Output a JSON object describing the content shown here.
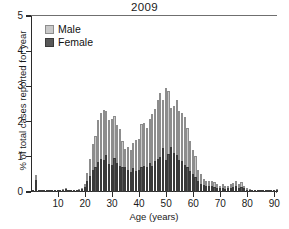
{
  "chart_data": {
    "type": "bar",
    "title": "2009",
    "xlabel": "Age (years)",
    "ylabel": "% of total cases reported for year",
    "xlim": [
      0,
      91
    ],
    "ylim": [
      0,
      5
    ],
    "xticks": [
      10,
      20,
      30,
      40,
      50,
      60,
      70,
      80,
      90
    ],
    "yticks": [
      0,
      1,
      2,
      3,
      4,
      5
    ],
    "grid": false,
    "stacked": true,
    "legend_position": "top-left",
    "bin_width_years": 1,
    "colors": {
      "male": "#c9c9c9",
      "female": "#585858",
      "axis": "#2b2b2b"
    },
    "x": [
      0,
      1,
      2,
      3,
      4,
      5,
      6,
      7,
      8,
      9,
      10,
      11,
      12,
      13,
      14,
      15,
      16,
      17,
      18,
      19,
      20,
      21,
      22,
      23,
      24,
      25,
      26,
      27,
      28,
      29,
      30,
      31,
      32,
      33,
      34,
      35,
      36,
      37,
      38,
      39,
      40,
      41,
      42,
      43,
      44,
      45,
      46,
      47,
      48,
      49,
      50,
      51,
      52,
      53,
      54,
      55,
      56,
      57,
      58,
      59,
      60,
      61,
      62,
      63,
      64,
      65,
      66,
      67,
      68,
      69,
      70,
      71,
      72,
      73,
      74,
      75,
      76,
      77,
      78,
      79,
      80,
      81,
      82,
      83,
      84,
      85,
      86,
      87,
      88,
      89,
      90
    ],
    "series": [
      {
        "name": "Male",
        "values": [
          0.02,
          0.47,
          0.05,
          0.03,
          0.04,
          0.02,
          0.06,
          0.05,
          0.04,
          0.06,
          0.03,
          0.08,
          0.1,
          0.07,
          0.06,
          0.05,
          0.04,
          0.08,
          0.1,
          0.22,
          0.55,
          0.95,
          1.35,
          1.6,
          2.05,
          2.25,
          2.32,
          2.3,
          2.05,
          2.08,
          2.17,
          1.9,
          1.78,
          1.45,
          1.22,
          1.28,
          1.18,
          1.38,
          1.48,
          1.5,
          1.92,
          1.95,
          1.82,
          2.08,
          2.22,
          2.35,
          2.6,
          2.8,
          2.62,
          2.95,
          2.88,
          2.38,
          2.45,
          2.6,
          2.3,
          2.25,
          2.12,
          1.82,
          1.45,
          1.2,
          1.02,
          0.62,
          0.52,
          0.38,
          0.32,
          0.3,
          0.32,
          0.28,
          0.22,
          0.18,
          0.22,
          0.16,
          0.18,
          0.22,
          0.26,
          0.3,
          0.22,
          0.28,
          0.18,
          0.12,
          0.09,
          0.04,
          0.03,
          0.02,
          0.02,
          0.01,
          0.01,
          0.01,
          0.01,
          0.01,
          0.08
        ]
      },
      {
        "name": "Female",
        "values": [
          0.02,
          0.33,
          0.04,
          0.03,
          0.03,
          0.02,
          0.04,
          0.03,
          0.03,
          0.04,
          0.02,
          0.06,
          0.08,
          0.05,
          0.05,
          0.04,
          0.03,
          0.06,
          0.08,
          0.14,
          0.3,
          0.45,
          0.62,
          0.7,
          0.85,
          0.95,
          0.9,
          1.05,
          0.8,
          0.78,
          0.98,
          0.82,
          0.75,
          0.72,
          0.7,
          0.62,
          0.58,
          0.68,
          0.6,
          0.62,
          0.72,
          0.75,
          0.7,
          0.82,
          0.75,
          0.88,
          0.95,
          1.0,
          1.25,
          0.92,
          1.08,
          1.28,
          1.12,
          1.05,
          0.92,
          0.88,
          0.78,
          0.72,
          0.6,
          0.52,
          0.42,
          0.3,
          0.24,
          0.2,
          0.17,
          0.16,
          0.17,
          0.15,
          0.12,
          0.1,
          0.12,
          0.09,
          0.1,
          0.12,
          0.14,
          0.16,
          0.12,
          0.15,
          0.1,
          0.07,
          0.05,
          0.02,
          0.02,
          0.01,
          0.01,
          0.01,
          0.01,
          0.01,
          0.01,
          0.01,
          0.04
        ]
      }
    ]
  },
  "legend": {
    "items": [
      {
        "label": "Male",
        "swatch": "male-swatch"
      },
      {
        "label": "Female",
        "swatch": "female-swatch"
      }
    ]
  }
}
